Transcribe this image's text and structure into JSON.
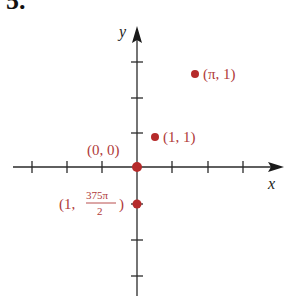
{
  "problem_number": "5.",
  "colors": {
    "axis": "#2a2a2a",
    "point": "#b52a2a",
    "label": "#b03a3a"
  },
  "axes": {
    "x_label": "x",
    "y_label": "y"
  },
  "points": [
    {
      "label": "(0, 0)",
      "r": 0,
      "theta": "0"
    },
    {
      "label": "(1, 1)",
      "r": 1,
      "theta": "1"
    },
    {
      "label": "(π, 1)",
      "r": "π",
      "theta": "1"
    },
    {
      "label": "(1, 375π/2)",
      "r": 1,
      "theta": "375π/2"
    }
  ],
  "label_parts": {
    "p4_prefix": "(1,",
    "p4_num": "375π",
    "p4_den": "2",
    "p4_suffix": ")"
  }
}
